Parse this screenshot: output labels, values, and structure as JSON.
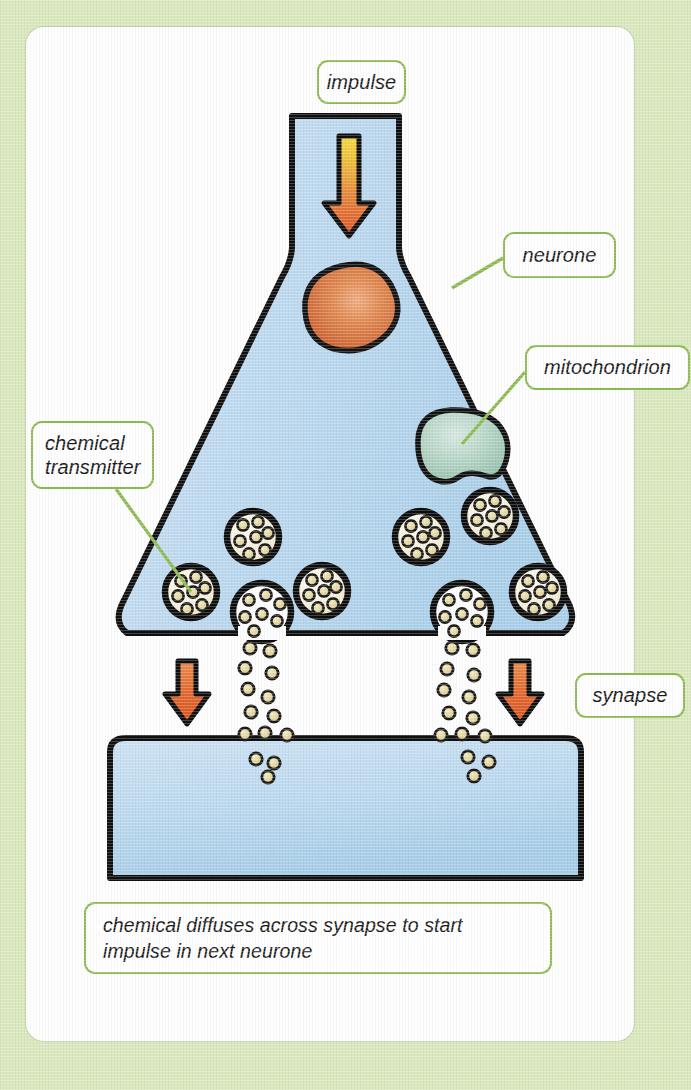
{
  "labels": {
    "impulse": "impulse",
    "neurone": "neurone",
    "mitochondrion": "mitochondrion",
    "chemical_transmitter": "chemical\ntransmitter",
    "synapse": "synapse"
  },
  "caption": {
    "text": "chemical diffuses across synapse to start\nimpulse in next neurone"
  },
  "structures": {
    "upper_neurone": "presynaptic neurone terminal",
    "lower_neurone": "postsynaptic next neurone",
    "nucleus": "nucleus",
    "mitochondrion": "mitochondrion",
    "vesicles": "chemical transmitter vesicles",
    "synaptic_cleft": "synapse gap",
    "impulse_arrow": "impulse direction arrow",
    "diffusion_arrows": "diffusion direction arrows"
  },
  "colors": {
    "background": "#d9e8bd",
    "card": "#fefefe",
    "label_border": "#8dbb52",
    "leader_line": "#8dbb52",
    "cytoplasm": "#bcd8ee",
    "outline": "#111111",
    "nucleus": "#d4622c",
    "mitochondrion": "#a8cbbd",
    "vesicle_fill": "#f6f1dc",
    "granule": "#e8dfa8",
    "arrow": "#e2622f",
    "impulse_gradient_start": "#f0d73e",
    "impulse_gradient_end": "#de5c28"
  }
}
